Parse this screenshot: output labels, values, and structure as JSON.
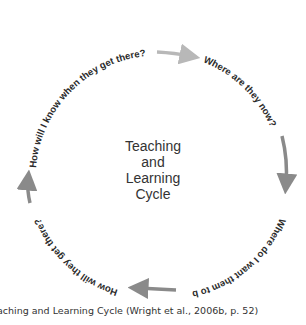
{
  "diagram": {
    "center_label": [
      "Teaching",
      "and",
      "Learning",
      "Cycle"
    ],
    "questions": [
      "Where are they now?",
      "Where do I want them to be?",
      "How will they get there?",
      "How will I know when they get there?"
    ],
    "arrow_color": "#8a8a8a",
    "arrow_color_light": "#b8b8b8"
  },
  "caption": "aching and Learning Cycle (Wright et al., 2006b, p. 52)"
}
